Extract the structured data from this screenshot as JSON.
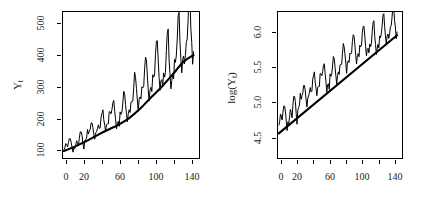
{
  "figure": {
    "background_color": "#ffffff",
    "foreground_color": "#000000",
    "panel_count": 2
  },
  "chart_data": [
    {
      "id": "panel-left",
      "type": "line",
      "title": "",
      "xlabel": "",
      "ylabel": "Y_t",
      "ylabel_display": "Y",
      "ylabel_subscript": "t",
      "xlim": [
        0,
        150
      ],
      "ylim": [
        85,
        560
      ],
      "grid": false,
      "legend": "none",
      "x_ticks": [
        0,
        20,
        40,
        60,
        80,
        100,
        120,
        140
      ],
      "x_tick_labels": [
        "0",
        "20",
        "",
        "60",
        "",
        "100",
        "",
        "140"
      ],
      "y_ticks": [
        100,
        200,
        300,
        400,
        500
      ],
      "y_tick_labels": [
        "100",
        "200",
        "300",
        "400",
        "500"
      ],
      "series": [
        {
          "name": "Y_t",
          "kind": "observed",
          "color": "#000000",
          "linewidth": 1,
          "x": [
            1,
            2,
            3,
            4,
            5,
            6,
            7,
            8,
            9,
            10,
            11,
            12,
            13,
            14,
            15,
            16,
            17,
            18,
            19,
            20,
            21,
            22,
            23,
            24,
            25,
            26,
            27,
            28,
            29,
            30,
            31,
            32,
            33,
            34,
            35,
            36,
            37,
            38,
            39,
            40,
            41,
            42,
            43,
            44,
            45,
            46,
            47,
            48,
            49,
            50,
            51,
            52,
            53,
            54,
            55,
            56,
            57,
            58,
            59,
            60,
            61,
            62,
            63,
            64,
            65,
            66,
            67,
            68,
            69,
            70,
            71,
            72,
            73,
            74,
            75,
            76,
            77,
            78,
            79,
            80,
            81,
            82,
            83,
            84,
            85,
            86,
            87,
            88,
            89,
            90,
            91,
            92,
            93,
            94,
            95,
            96,
            97,
            98,
            99,
            100,
            101,
            102,
            103,
            104,
            105,
            106,
            107,
            108,
            109,
            110,
            111,
            112,
            113,
            114,
            115,
            116,
            117,
            118,
            119,
            120,
            121,
            122,
            123,
            124,
            125,
            126,
            127,
            128,
            129,
            130,
            131,
            132,
            133,
            134,
            135,
            136,
            137,
            138,
            139,
            140,
            141,
            142,
            143,
            144
          ],
          "values": [
            112,
            118,
            132,
            129,
            121,
            135,
            148,
            148,
            136,
            119,
            104,
            118,
            115,
            126,
            141,
            135,
            125,
            149,
            170,
            170,
            158,
            133,
            114,
            140,
            145,
            150,
            178,
            163,
            172,
            178,
            199,
            199,
            184,
            162,
            146,
            166,
            171,
            180,
            193,
            181,
            183,
            218,
            230,
            242,
            209,
            191,
            172,
            194,
            196,
            196,
            236,
            235,
            229,
            243,
            264,
            272,
            237,
            211,
            180,
            201,
            204,
            188,
            235,
            227,
            234,
            264,
            302,
            293,
            259,
            229,
            203,
            229,
            242,
            233,
            267,
            269,
            270,
            315,
            364,
            347,
            312,
            274,
            237,
            278,
            284,
            277,
            317,
            313,
            318,
            374,
            413,
            405,
            355,
            306,
            271,
            306,
            315,
            301,
            356,
            348,
            355,
            422,
            465,
            467,
            404,
            347,
            305,
            336,
            340,
            318,
            362,
            348,
            363,
            435,
            491,
            505,
            404,
            359,
            310,
            337,
            360,
            342,
            406,
            396,
            420,
            472,
            548,
            559,
            463,
            407,
            362,
            405,
            417,
            391,
            419,
            461,
            472,
            535,
            622,
            606,
            508,
            461,
            390,
            432
          ]
        },
        {
          "name": "trend",
          "kind": "smooth-trend",
          "color": "#000000",
          "linewidth": 2,
          "x": [
            1,
            13,
            25,
            37,
            49,
            61,
            73,
            85,
            97,
            109,
            121,
            133,
            144
          ],
          "values": [
            108,
            122,
            139,
            158,
            176,
            193,
            215,
            245,
            282,
            317,
            357,
            398,
            420
          ]
        }
      ]
    },
    {
      "id": "panel-right",
      "type": "line",
      "title": "",
      "xlabel": "",
      "ylabel": "log(Y_t)",
      "ylabel_prefix": "log(",
      "ylabel_display": "Y",
      "ylabel_subscript": "t",
      "ylabel_suffix": ")",
      "xlim": [
        0,
        150
      ],
      "ylim": [
        4.25,
        6.35
      ],
      "grid": false,
      "legend": "none",
      "x_ticks": [
        0,
        20,
        40,
        60,
        80,
        100,
        120,
        140
      ],
      "x_tick_labels": [
        "0",
        "20",
        "",
        "60",
        "",
        "100",
        "",
        "140"
      ],
      "y_ticks": [
        4.5,
        5.0,
        5.5,
        6.0
      ],
      "y_tick_labels": [
        "4.5",
        "5.0",
        "5.5",
        "6.0"
      ],
      "series": [
        {
          "name": "log(Y_t)",
          "kind": "observed",
          "color": "#000000",
          "linewidth": 1,
          "x": [
            1,
            2,
            3,
            4,
            5,
            6,
            7,
            8,
            9,
            10,
            11,
            12,
            13,
            14,
            15,
            16,
            17,
            18,
            19,
            20,
            21,
            22,
            23,
            24,
            25,
            26,
            27,
            28,
            29,
            30,
            31,
            32,
            33,
            34,
            35,
            36,
            37,
            38,
            39,
            40,
            41,
            42,
            43,
            44,
            45,
            46,
            47,
            48,
            49,
            50,
            51,
            52,
            53,
            54,
            55,
            56,
            57,
            58,
            59,
            60,
            61,
            62,
            63,
            64,
            65,
            66,
            67,
            68,
            69,
            70,
            71,
            72,
            73,
            74,
            75,
            76,
            77,
            78,
            79,
            80,
            81,
            82,
            83,
            84,
            85,
            86,
            87,
            88,
            89,
            90,
            91,
            92,
            93,
            94,
            95,
            96,
            97,
            98,
            99,
            100,
            101,
            102,
            103,
            104,
            105,
            106,
            107,
            108,
            109,
            110,
            111,
            112,
            113,
            114,
            115,
            116,
            117,
            118,
            119,
            120,
            121,
            122,
            123,
            124,
            125,
            126,
            127,
            128,
            129,
            130,
            131,
            132,
            133,
            134,
            135,
            136,
            137,
            138,
            139,
            140,
            141,
            142,
            143,
            144
          ],
          "values": [
            4.718,
            4.771,
            4.883,
            4.86,
            4.796,
            4.905,
            4.997,
            4.997,
            4.913,
            4.779,
            4.644,
            4.771,
            4.745,
            4.836,
            4.949,
            4.905,
            4.828,
            5.004,
            5.136,
            5.136,
            5.063,
            4.89,
            4.736,
            4.942,
            4.977,
            5.011,
            5.182,
            5.094,
            5.147,
            5.182,
            5.293,
            5.293,
            5.215,
            5.088,
            4.984,
            5.112,
            5.142,
            5.193,
            5.263,
            5.198,
            5.21,
            5.384,
            5.438,
            5.489,
            5.342,
            5.252,
            5.147,
            5.268,
            5.278,
            5.278,
            5.464,
            5.46,
            5.434,
            5.493,
            5.576,
            5.606,
            5.468,
            5.352,
            5.193,
            5.303,
            5.318,
            5.236,
            5.46,
            5.425,
            5.455,
            5.576,
            5.71,
            5.68,
            5.557,
            5.434,
            5.313,
            5.434,
            5.489,
            5.451,
            5.587,
            5.595,
            5.598,
            5.753,
            5.897,
            5.849,
            5.743,
            5.613,
            5.468,
            5.628,
            5.649,
            5.624,
            5.759,
            5.746,
            5.762,
            5.924,
            6.023,
            6.004,
            5.872,
            5.724,
            5.602,
            5.724,
            5.753,
            5.707,
            5.875,
            5.852,
            5.872,
            6.045,
            6.142,
            6.146,
            6.001,
            5.849,
            5.72,
            5.817,
            5.829,
            5.762,
            5.892,
            5.852,
            5.894,
            6.075,
            6.196,
            6.225,
            6.001,
            5.883,
            5.737,
            5.82,
            5.886,
            5.835,
            6.006,
            5.981,
            6.04,
            6.157,
            6.306,
            6.326,
            6.138,
            6.009,
            5.892,
            6.004,
            6.033,
            5.969,
            6.038,
            6.133,
            6.157,
            6.282,
            6.433,
            6.407,
            6.23,
            6.133,
            5.966,
            6.068
          ]
        },
        {
          "name": "trend",
          "kind": "linear-trend",
          "color": "#000000",
          "linewidth": 2,
          "x": [
            1,
            144
          ],
          "values": [
            4.605,
            6.015
          ]
        }
      ]
    }
  ]
}
